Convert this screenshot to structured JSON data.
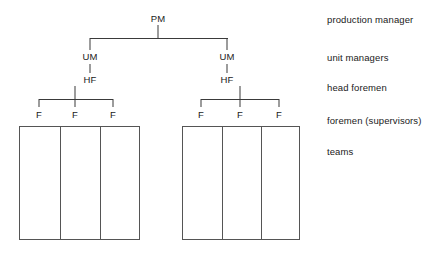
{
  "diagram": {
    "type": "org-chart",
    "line_color": "#3a3a3a",
    "box_border_color": "#555555",
    "text_color": "#1a1a1a",
    "background": "#ffffff",
    "levels": [
      {
        "key": "production_manager",
        "abbrev": "PM",
        "label": "production manager",
        "count": 1
      },
      {
        "key": "unit_managers",
        "abbrev": "UM",
        "label": "unit managers",
        "count": 2
      },
      {
        "key": "head_foremen",
        "abbrev": "HF",
        "label": "head foremen",
        "count": 2
      },
      {
        "key": "foremen_supervisors",
        "abbrev": "F",
        "label": "foremen (supervisors)",
        "count": 6
      },
      {
        "key": "teams",
        "abbrev": "",
        "label": "teams",
        "count": 6
      }
    ],
    "nodes": {
      "pm": {
        "abbrev": "PM"
      },
      "um_left": {
        "abbrev": "UM"
      },
      "um_right": {
        "abbrev": "UM"
      },
      "hf_left": {
        "abbrev": "HF"
      },
      "hf_right": {
        "abbrev": "HF"
      },
      "f_left": [
        {
          "abbrev": "F"
        },
        {
          "abbrev": "F"
        },
        {
          "abbrev": "F"
        }
      ],
      "f_right": [
        {
          "abbrev": "F"
        },
        {
          "abbrev": "F"
        },
        {
          "abbrev": "F"
        }
      ]
    },
    "legend": [
      {
        "label": "production manager"
      },
      {
        "label": "unit managers"
      },
      {
        "label": "head foremen"
      },
      {
        "label": "foremen (supervisors)"
      },
      {
        "label": "teams"
      }
    ],
    "team_groups": [
      {
        "name": "left-team-group",
        "columns": 3
      },
      {
        "name": "right-team-group",
        "columns": 3
      }
    ]
  }
}
